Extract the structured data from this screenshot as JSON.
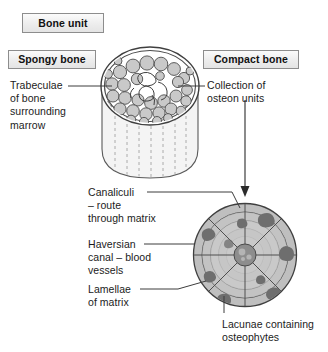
{
  "figure": {
    "title_box": "Bone unit",
    "section_left": "Spongy bone",
    "section_right": "Compact bone"
  },
  "labels": {
    "trabeculae": "Trabeculae\nof bone\nsurrounding\nmarrow",
    "collection": "Collection of\nosteon units",
    "canaliculi": "Canaliculi\n– route\nthrough matrix",
    "haversian": "Haversian\ncanal – blood\nvessels",
    "lamellae": "Lamellae\nof matrix",
    "lacunae": "Lacunae containing\nosteophytes"
  },
  "colors": {
    "ink": "#1b1b1b",
    "line": "#4a4a4a",
    "box_fill": "#ededed",
    "box_border": "#8d8d8d",
    "trabecula_fill": "#c9c9c9",
    "cylinder_body": "#f2f2f2",
    "osteon_fill": "#bdbdbd",
    "osteon_ring": "#d0d0d0",
    "haversian_canal": "#8a8a8a",
    "lacunae": "#6f6f6f"
  },
  "diagram": {
    "type": "anatomical-cross-section",
    "spongy_cylinder": {
      "center_x": 150,
      "top_face_cy": 86,
      "rx": 48,
      "ry": 38,
      "body_bottom_y": 176,
      "trabeculae_count": 34,
      "vertical_dash_lines": 7
    },
    "osteon": {
      "center_x": 245,
      "center_y": 255,
      "outer_r": 52,
      "ring_radii": [
        52,
        43,
        34,
        26,
        18
      ],
      "haversian_r": 11,
      "radial_lines": 8,
      "lacunae_count": 9
    },
    "arrow": {
      "x": 245,
      "from_y": 100,
      "to_y": 196
    }
  }
}
